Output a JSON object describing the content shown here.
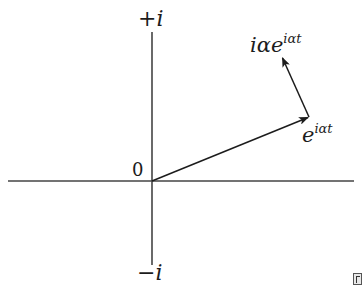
{
  "diagram": {
    "axes": {
      "positive_imaginary_label": "+i",
      "negative_imaginary_label": "−i",
      "origin_label": "0",
      "color": "#444444"
    },
    "vectors": [
      {
        "id": "position",
        "label_base": "e",
        "label_exponent": "iαt",
        "from": [
          152,
          181
        ],
        "to": [
          309,
          117
        ]
      },
      {
        "id": "velocity",
        "label_base": "iαe",
        "label_exponent": "iαt",
        "from": [
          309,
          117
        ],
        "to": [
          282,
          57
        ]
      }
    ],
    "stroke_color": "#1c1c1c",
    "corner_icon": "page-icon"
  }
}
